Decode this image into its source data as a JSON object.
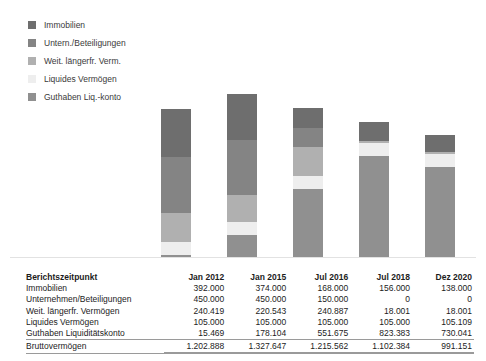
{
  "legend": {
    "items": [
      {
        "label": "Immobilien",
        "color": "#6e6e6e",
        "key": "immobilien"
      },
      {
        "label": "Untern./Beteiligungen",
        "color": "#848484",
        "key": "unternehmen"
      },
      {
        "label": "Weit. längerfr. Verm.",
        "color": "#b0b0b0",
        "key": "weit_laengerfr"
      },
      {
        "label": "Liquides Vermögen",
        "color": "#eeeeee",
        "key": "liquides"
      },
      {
        "label": "Guthaben Liq.-konto",
        "color": "#909090",
        "key": "guthaben"
      }
    ]
  },
  "table": {
    "row_label_header": "Berichtszeitpunkt",
    "columns": [
      "Jan 2012",
      "Jan 2015",
      "Jul 2016",
      "Jul 2018",
      "Dez 2020"
    ],
    "rows": [
      {
        "label": "Immobilien",
        "values": [
          "392.000",
          "374.000",
          "168.000",
          "156.000",
          "138.000"
        ]
      },
      {
        "label": "Unternehmen/Beteiligungen",
        "values": [
          "450.000",
          "450.000",
          "150.000",
          "0",
          "0"
        ]
      },
      {
        "label": "Weit. längerfr. Vermögen",
        "values": [
          "240.419",
          "220.543",
          "240.887",
          "18.001",
          "18.001"
        ]
      },
      {
        "label": "Liquides Vermögen",
        "values": [
          "105.000",
          "105.000",
          "105.000",
          "105.000",
          "105.109"
        ]
      },
      {
        "label": "Guthaben Liquiditätskonto",
        "values": [
          "15.469",
          "178.104",
          "551.675",
          "823.383",
          "730.041"
        ]
      }
    ],
    "total": {
      "label": "Bruttovermögen",
      "values": [
        "1.202.888",
        "1.327.647",
        "1.215.562",
        "1.102.384",
        "991.151"
      ]
    }
  },
  "chart_data": {
    "type": "bar",
    "stacked": true,
    "title": "",
    "xlabel": "",
    "ylabel": "",
    "grid": false,
    "legend_position": "top-left",
    "categories": [
      "Jan 2012",
      "Jan 2015",
      "Jul 2016",
      "Jul 2018",
      "Dez 2020"
    ],
    "ylim": [
      0,
      1400000
    ],
    "series": [
      {
        "name": "Immobilien",
        "color": "#6e6e6e",
        "values": [
          392000,
          374000,
          168000,
          156000,
          138000
        ]
      },
      {
        "name": "Untern./Beteiligungen",
        "color": "#848484",
        "values": [
          450000,
          450000,
          150000,
          0,
          0
        ]
      },
      {
        "name": "Weit. längerfr. Verm.",
        "color": "#b0b0b0",
        "values": [
          240419,
          220543,
          240887,
          18001,
          18001
        ]
      },
      {
        "name": "Liquides Vermögen",
        "color": "#eeeeee",
        "values": [
          105000,
          105000,
          105000,
          105000,
          105109
        ]
      },
      {
        "name": "Guthaben Liq.-konto",
        "color": "#909090",
        "values": [
          15469,
          178104,
          551675,
          823383,
          730041
        ]
      }
    ],
    "totals": [
      1202888,
      1327647,
      1215562,
      1102384,
      991151
    ],
    "bar_x_positions": [
      161,
      227,
      293,
      359,
      425
    ],
    "bar_width": 30,
    "baseline_y": 257,
    "plot_height": 172
  }
}
